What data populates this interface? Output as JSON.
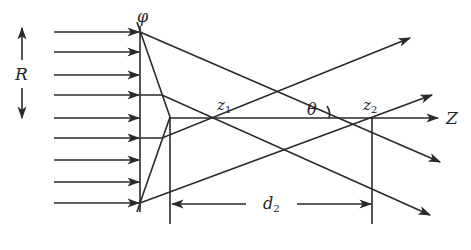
{
  "diagram": {
    "labels": {
      "phi": "φ",
      "R": "R",
      "z1": "z",
      "z1_sub": "1",
      "z2": "z",
      "z2_sub": "2",
      "theta": "θ",
      "axis": "Z",
      "d2": "d",
      "d2_sub": "2"
    },
    "incoming_rays_y": [
      28,
      52,
      76,
      96,
      117,
      137,
      160,
      182,
      204
    ],
    "colors": {
      "line": "#2a2a2a",
      "background": "#ffffff"
    }
  }
}
